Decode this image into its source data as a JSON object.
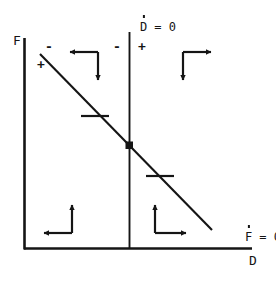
{
  "figure": {
    "type": "phase-plane-diagram",
    "background_color": "#ffffff",
    "line_color": "#151515",
    "width": 276,
    "height": 284
  },
  "axes": {
    "y_axis_label": "F",
    "x_axis_label": "D",
    "origin_x": 24,
    "origin_y": 249,
    "y_axis_top": 38,
    "x_axis_right": 252
  },
  "nullclines": {
    "vertical": {
      "label_var": "D",
      "label_rest": " = 0",
      "x": 129,
      "y_top": 32,
      "y_bottom": 249
    },
    "sloped": {
      "label_var": "F",
      "label_rest": " = 0",
      "x1": 40,
      "y1": 54,
      "x2": 212,
      "y2": 230
    }
  },
  "equilibrium": {
    "name": "steady-state-point",
    "x": 129,
    "y": 145
  },
  "signs": [
    {
      "text": "-",
      "x": 47,
      "y": 47,
      "region": "above-sloped-nullcline-left"
    },
    {
      "text": "+",
      "x": 40,
      "y": 64,
      "region": "below-sloped-nullcline-left"
    },
    {
      "text": "-",
      "x": 115,
      "y": 44,
      "region": "left-of-vertical-nullcline"
    },
    {
      "text": "+",
      "x": 139,
      "y": 44,
      "region": "right-of-vertical-nullcline"
    }
  ],
  "tick_marks": [
    {
      "name": "sloped-nullcline-tick-upper",
      "cx": 95,
      "cy": 116,
      "half_width": 14
    },
    {
      "name": "sloped-nullcline-tick-lower",
      "cx": 160,
      "cy": 176,
      "half_width": 14
    }
  ],
  "arrow_pairs": [
    {
      "name": "quadrant-upper-left",
      "corner_x": 98,
      "corner_y": 52,
      "horizontal": {
        "to_x": 68,
        "direction": "left"
      },
      "vertical": {
        "to_y": 82,
        "direction": "down"
      }
    },
    {
      "name": "quadrant-upper-right",
      "corner_x": 183,
      "corner_y": 52,
      "horizontal": {
        "to_x": 213,
        "direction": "right"
      },
      "vertical": {
        "to_y": 82,
        "direction": "down"
      }
    },
    {
      "name": "quadrant-lower-left",
      "corner_x": 72,
      "corner_y": 233,
      "horizontal": {
        "to_x": 42,
        "direction": "left"
      },
      "vertical": {
        "to_y": 203,
        "direction": "up"
      }
    },
    {
      "name": "quadrant-lower-right",
      "corner_x": 155,
      "corner_y": 233,
      "horizontal": {
        "to_x": 188,
        "direction": "right"
      },
      "vertical": {
        "to_y": 203,
        "direction": "up"
      }
    }
  ],
  "labels": {
    "f_axis": {
      "x": 14,
      "y": 36
    },
    "d_axis": {
      "x": 250,
      "y": 255
    },
    "d_dot_nullcline": {
      "x": 111,
      "y": 8
    },
    "f_dot_nullcline": {
      "x": 216,
      "y": 218
    }
  }
}
